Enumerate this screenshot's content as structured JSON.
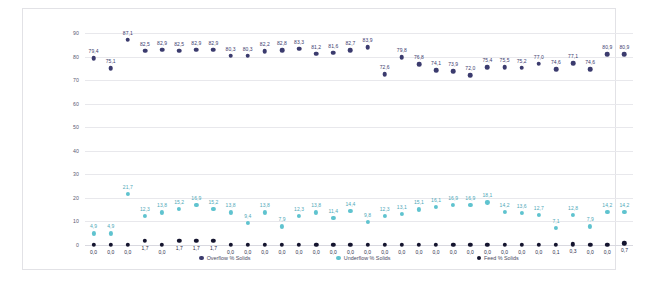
{
  "chart_data": {
    "type": "scatter",
    "title": "",
    "xlabel": "",
    "ylabel": "",
    "ylim": [
      0,
      90
    ],
    "yticks": [
      0,
      10,
      20,
      30,
      40,
      50,
      60,
      70,
      80,
      90
    ],
    "grid": true,
    "legend_position": "bottom",
    "x": [
      1,
      2,
      3,
      4,
      5,
      6,
      7,
      8,
      9,
      10,
      11,
      12,
      13,
      14,
      15,
      16,
      17,
      18,
      19,
      20,
      21,
      22,
      23,
      24,
      25,
      26,
      27,
      28,
      29,
      30,
      31,
      32
    ],
    "series": [
      {
        "name": "Overflow % Solids",
        "color": "#3b3b6e",
        "values": [
          79.4,
          75.1,
          87.1,
          82.5,
          82.9,
          82.5,
          82.9,
          82.9,
          80.3,
          80.3,
          82.2,
          82.8,
          83.3,
          81.2,
          81.6,
          82.7,
          83.9,
          72.6,
          79.8,
          76.8,
          74.1,
          73.9,
          72.0,
          75.4,
          75.5,
          75.2,
          77.0,
          74.6,
          77.1,
          74.6,
          80.9,
          80.9
        ]
      },
      {
        "name": "Underflow % Solids",
        "color": "#5fc3cf",
        "values": [
          4.9,
          4.9,
          21.7,
          12.3,
          13.8,
          15.2,
          16.9,
          15.2,
          13.8,
          9.4,
          13.8,
          7.9,
          12.3,
          13.8,
          11.4,
          14.4,
          9.8,
          12.3,
          13.1,
          15.1,
          16.1,
          16.9,
          16.9,
          18.1,
          14.2,
          13.6,
          12.7,
          7.1,
          12.8,
          7.9,
          14.2,
          14.2
        ]
      },
      {
        "name": "Feed % Solids",
        "color": "#14142e",
        "values": [
          0.0,
          0.0,
          0.0,
          1.7,
          0.0,
          1.7,
          1.7,
          1.7,
          0.0,
          0.0,
          0.0,
          0.0,
          0.0,
          0.0,
          0.0,
          0.0,
          0.0,
          0.0,
          0.0,
          0.0,
          0.0,
          0.0,
          0.0,
          0.0,
          0.0,
          0.0,
          0.0,
          0.1,
          0.3,
          0.0,
          0.0,
          0.7
        ]
      }
    ],
    "labels": {
      "Overflow % Solids": [
        "79,4",
        "75,1",
        "87,1",
        "82,5",
        "82,9",
        "82,5",
        "82,9",
        "82,9",
        "80,3",
        "80,3",
        "82,2",
        "82,8",
        "83,3",
        "81,2",
        "81,6",
        "82,7",
        "83,9",
        "72,6",
        "79,8",
        "76,8",
        "74,1",
        "73,9",
        "72,0",
        "75,4",
        "75,5",
        "75,2",
        "77,0",
        "74,6",
        "77,1",
        "74,6",
        "80,9",
        "80,9"
      ],
      "Underflow % Solids": [
        "4,9",
        "4,9",
        "21,7",
        "12,3",
        "13,8",
        "15,2",
        "16,9",
        "15,2",
        "13,8",
        "9,4",
        "13,8",
        "7,9",
        "12,3",
        "13,8",
        "11,4",
        "14,4",
        "9,8",
        "12,3",
        "13,1",
        "15,1",
        "16,1",
        "16,9",
        "16,9",
        "18,1",
        "14,2",
        "13,6",
        "12,7",
        "7,1",
        "12,8",
        "7,9",
        "14,2",
        "14,2"
      ],
      "Feed % Solids": [
        "0,0",
        "0,0",
        "0,0",
        "1,7",
        "0,0",
        "1,7",
        "1,7",
        "1,7",
        "0,0",
        "0,0",
        "0,0",
        "0,0",
        "0,0",
        "0,0",
        "0,0",
        "0,0",
        "0,0",
        "0,0",
        "0,0",
        "0,0",
        "0,0",
        "0,0",
        "0,0",
        "0,0",
        "0,0",
        "0,0",
        "0,0",
        "0,1",
        "0,3",
        "0,0",
        "0,0",
        "0,7"
      ]
    }
  }
}
